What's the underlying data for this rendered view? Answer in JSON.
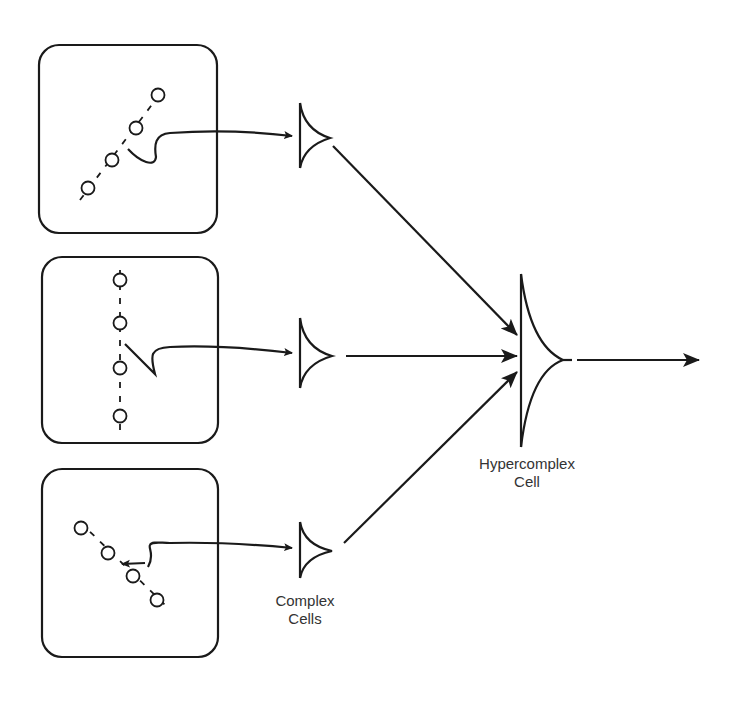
{
  "diagram": {
    "labels": {
      "complex_line1": "Complex",
      "complex_line2": "Cells",
      "hyper_line1": "Hypercomplex",
      "hyper_line2": "Cell"
    },
    "receptive_fields": [
      {
        "orientation": "diagonal-up",
        "circles": 4
      },
      {
        "orientation": "vertical",
        "circles": 4
      },
      {
        "orientation": "diagonal-down",
        "circles": 4
      }
    ],
    "complex_cells": 3,
    "hypercomplex_cells": 1,
    "colors": {
      "stroke": "#1a1a1a",
      "text": "#333333",
      "background": "#ffffff"
    }
  }
}
